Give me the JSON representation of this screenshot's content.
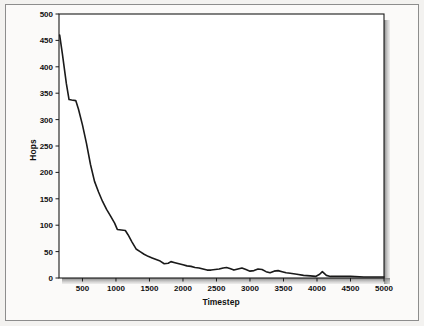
{
  "figure": {
    "background_color": "#f3f2f0",
    "plot_background_color": "#ffffff",
    "frame_color": "#8d8d8d",
    "axis_color": "#1a1a1a",
    "line_color": "#1a1a1a",
    "shadow_color": "#8a8a8a"
  },
  "chart_data": {
    "type": "line",
    "title": "",
    "xlabel": "Timestep",
    "ylabel": "Hops",
    "xlim": [
      150,
      5000
    ],
    "ylim": [
      0,
      500
    ],
    "grid": false,
    "legend": null,
    "xticks": [
      500,
      1000,
      1500,
      2000,
      2500,
      3000,
      3500,
      4000,
      4500,
      5000
    ],
    "xtick_labels": [
      "500",
      "1000",
      "1500",
      "2000",
      "2500",
      "3000",
      "3500",
      "4000",
      "4500",
      "5000"
    ],
    "yticks": [
      0,
      50,
      100,
      150,
      200,
      250,
      300,
      350,
      400,
      450,
      500
    ],
    "ytick_labels": [
      "0",
      "50",
      "100",
      "150",
      "200",
      "250",
      "300",
      "350",
      "400",
      "450",
      "500"
    ],
    "series": [
      {
        "name": "hops",
        "x": [
          160,
          200,
          260,
          300,
          340,
          400,
          440,
          500,
          560,
          620,
          680,
          740,
          800,
          860,
          920,
          980,
          1020,
          1080,
          1140,
          1180,
          1240,
          1300,
          1360,
          1420,
          1480,
          1540,
          1600,
          1660,
          1720,
          1780,
          1820,
          1880,
          1940,
          2000,
          2060,
          2120,
          2180,
          2240,
          2300,
          2360,
          2420,
          2480,
          2540,
          2600,
          2650,
          2700,
          2760,
          2820,
          2880,
          2940,
          3000,
          3060,
          3120,
          3180,
          3240,
          3300,
          3360,
          3420,
          3480,
          3540,
          3600,
          3700,
          3800,
          3900,
          3980,
          4040,
          4080,
          4140,
          4200,
          4320,
          4500,
          4700,
          4850,
          5000
        ],
        "y": [
          460,
          425,
          368,
          338,
          337,
          336,
          320,
          290,
          255,
          215,
          183,
          163,
          145,
          130,
          117,
          104,
          92,
          91,
          90,
          82,
          68,
          55,
          50,
          45,
          41,
          38,
          35,
          32,
          27,
          28,
          31,
          29,
          27,
          25,
          23,
          22,
          20,
          19,
          17,
          15,
          15,
          16,
          17,
          19,
          20,
          18,
          15,
          17,
          19,
          16,
          13,
          14,
          17,
          16,
          12,
          10,
          13,
          14,
          12,
          10,
          9,
          7,
          5,
          4,
          3,
          7,
          12,
          5,
          3,
          3,
          3,
          2,
          2,
          2
        ]
      }
    ]
  }
}
